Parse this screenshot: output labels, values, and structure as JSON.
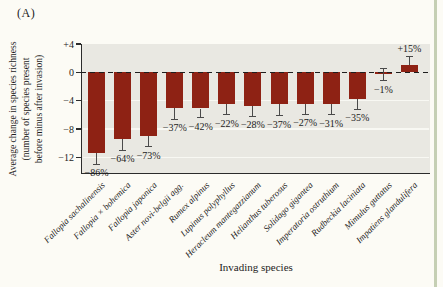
{
  "panel_label": "(A)",
  "y_axis": {
    "label_lines": [
      "Average change in species richness",
      "(number of species present",
      "before minus after invasion)"
    ],
    "ticks": [
      {
        "value": 4,
        "label": "+4"
      },
      {
        "value": 0,
        "label": "0"
      },
      {
        "value": -4,
        "label": "−4"
      },
      {
        "value": -8,
        "label": "−8"
      },
      {
        "value": -12,
        "label": "−12"
      }
    ]
  },
  "x_axis": {
    "label": "Invading species"
  },
  "chart_data": {
    "type": "bar",
    "title": "",
    "xlabel": "Invading species",
    "ylabel": "Average change in species richness (number of species present before minus after invasion)",
    "ylim": [
      -14.2,
      4.0
    ],
    "grid": "horizontal-white-on-gray",
    "zero_line": "black-dashed",
    "categories": [
      "Fallopia sachalinensis",
      "Fallopia × bohemica",
      "Fallopia japonica",
      "Aster novi-belgii agg.",
      "Rumex alpinus",
      "Lupinus polyphyllus",
      "Heracleum mantegazzianum",
      "Helianthus tuberosus",
      "Solidago gigantea",
      "Imperatoria ostruthium",
      "Rudbeckia laciniata",
      "Mimulus guttatus",
      "Impatiens glandulifera"
    ],
    "values": [
      -11.4,
      -9.4,
      -9.0,
      -5.0,
      -5.1,
      -4.5,
      -4.7,
      -4.5,
      -4.4,
      -4.4,
      -3.7,
      -0.3,
      1.1
    ],
    "errors": [
      1.6,
      1.6,
      1.5,
      1.6,
      1.3,
      1.5,
      1.5,
      1.6,
      1.5,
      1.6,
      1.5,
      0.9,
      1.1
    ],
    "percent_labels": [
      "−86%",
      "−64%",
      "−73%",
      "−37%",
      "−42%",
      "−22%",
      "−28%",
      "−37%",
      "−27%",
      "−31%",
      "−35%",
      "−1%",
      "+15%"
    ]
  },
  "colors": {
    "bar": "#8e2214",
    "plot_background": "#e9e8e2",
    "page_background": "#fcfbf5",
    "gridline": "#f8f8f3",
    "axis": "#2b2b2b",
    "error_bar": "#4a4a4a",
    "page_edge_strip": "#c5cfb4"
  }
}
